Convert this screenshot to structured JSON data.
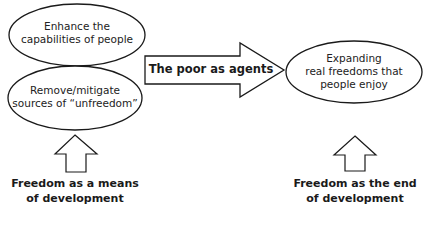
{
  "diagram": {
    "left_ellipses": [
      {
        "text_line1": "Enhance the",
        "text_line2": "capabilities of people"
      },
      {
        "text_line1": "Remove/mitigate",
        "text_line2": "sources of “unfreedom”"
      }
    ],
    "center_arrow": {
      "label": "The poor as agents"
    },
    "right_ellipse": {
      "text_line1": "Expanding",
      "text_line2": "real freedoms that",
      "text_line3": "people enjoy"
    },
    "captions": {
      "left": {
        "line1": "Freedom as a means",
        "line2": "of development"
      },
      "right": {
        "line1": "Freedom as the end",
        "line2": "of development"
      }
    },
    "colors": {
      "stroke": "#1a1a1a",
      "fill": "#ffffff",
      "background": "#ffffff"
    }
  }
}
